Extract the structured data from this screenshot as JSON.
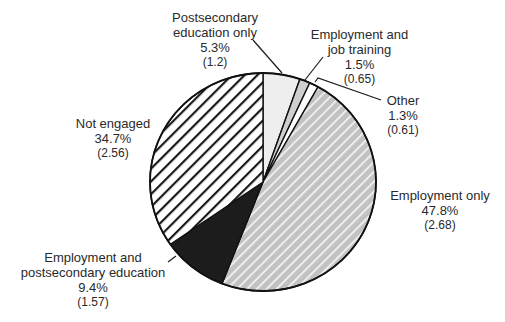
{
  "chart_data": {
    "type": "pie",
    "title": "",
    "start_angle_deg": 0,
    "direction": "clockwise",
    "slices": [
      {
        "label": "Postsecondary education only",
        "value": 5.3,
        "value_label": "5.3%",
        "se": "(1.2)",
        "fill": "#eeeeee",
        "pattern": "solid-light"
      },
      {
        "label": "Employment and job training",
        "value": 1.5,
        "value_label": "1.5%",
        "se": "(0.65)",
        "fill": "#cfcfcf",
        "pattern": "solid-gray"
      },
      {
        "label": "Other",
        "value": 1.3,
        "value_label": "1.3%",
        "se": "(0.61)",
        "fill": "#ffffff",
        "pattern": "solid-white"
      },
      {
        "label": "Employment only",
        "value": 47.8,
        "value_label": "47.8%",
        "se": "(2.68)",
        "fill": "#c4c4c4",
        "pattern": "diagonal-white-on-gray"
      },
      {
        "label": "Employment and postsecondary education",
        "value": 9.4,
        "value_label": "9.4%",
        "se": "(1.57)",
        "fill": "#1c1c1c",
        "pattern": "solid-black"
      },
      {
        "label": "Not engaged",
        "value": 34.7,
        "value_label": "34.7%",
        "se": "(2.56)",
        "fill": "#ffffff",
        "pattern": "diagonal-black-on-white"
      }
    ],
    "categories": [
      "Postsecondary education only",
      "Employment and job training",
      "Other",
      "Employment only",
      "Employment and postsecondary education",
      "Not engaged"
    ],
    "values": [
      5.3,
      1.5,
      1.3,
      47.8,
      9.4,
      34.7
    ],
    "standard_errors": [
      1.2,
      0.65,
      0.61,
      2.68,
      1.57,
      2.56
    ],
    "legend": "none (direct labels with leader lines)"
  },
  "labels": {
    "postsecondary": {
      "line1": "Postsecondary",
      "line2": "education only",
      "pct": "5.3%",
      "se": "(1.2)"
    },
    "job_training": {
      "line1": "Employment and",
      "line2": "job training",
      "pct": "1.5%",
      "se": "(0.65)"
    },
    "other": {
      "line1": "Other",
      "pct": "1.3%",
      "se": "(0.61)"
    },
    "employment_only": {
      "line1": "Employment only",
      "pct": "47.8%",
      "se": "(2.68)"
    },
    "emp_postsecondary": {
      "line1": "Employment and",
      "line2": "postsecondary education",
      "pct": "9.4%",
      "se": "(1.57)"
    },
    "not_engaged": {
      "line1": "Not engaged",
      "pct": "34.7%",
      "se": "(2.56)"
    }
  }
}
